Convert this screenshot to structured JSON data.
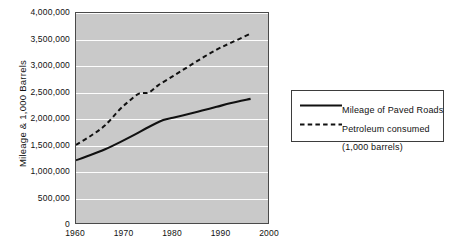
{
  "chart_data": {
    "type": "line",
    "title": "",
    "xlabel": "",
    "ylabel": "Mileage & 1,000 Barrels",
    "xlim": [
      1960,
      2000
    ],
    "ylim": [
      0,
      4000000
    ],
    "grid": true,
    "legend_position": "right",
    "x_ticks": [
      "1960",
      "1970",
      "1980",
      "1990",
      "2000"
    ],
    "x_tick_values": [
      1960,
      1970,
      1980,
      1990,
      2000
    ],
    "y_ticks": [
      "0",
      "500,000",
      "1,000,000",
      "1,500,000",
      "2,000,000",
      "2,500,000",
      "3,000,000",
      "3,500,000",
      "4,000,000"
    ],
    "y_tick_values": [
      0,
      500000,
      1000000,
      1500000,
      2000000,
      2500000,
      3000000,
      3500000,
      4000000
    ],
    "plot_background": "#c9c9c9",
    "gridline_color": "#fdfdfd",
    "series": [
      {
        "name": "Mileage of Paved Roads",
        "style": "solid",
        "color": "#111111",
        "x": [
          1960,
          1963,
          1966,
          1969,
          1972,
          1975,
          1978,
          1980,
          1983,
          1986,
          1989,
          1992,
          1996
        ],
        "values": [
          1220000,
          1320000,
          1430000,
          1560000,
          1700000,
          1850000,
          1980000,
          2025000,
          2090000,
          2160000,
          2230000,
          2300000,
          2380000
        ]
      },
      {
        "name": "Petroleum consumed",
        "sublabel": "(1,000 barrels)",
        "style": "dashed",
        "color": "#111111",
        "x": [
          1960,
          1963,
          1966,
          1969,
          1971,
          1973,
          1975,
          1977,
          1980,
          1983,
          1986,
          1989,
          1992,
          1996
        ],
        "values": [
          1510000,
          1680000,
          1880000,
          2180000,
          2340000,
          2480000,
          2500000,
          2640000,
          2810000,
          2980000,
          3150000,
          3310000,
          3440000,
          3610000
        ]
      }
    ]
  },
  "legend": {
    "entries": [
      {
        "label": "Mileage of Paved Roads",
        "sublabel": "",
        "style": "solid"
      },
      {
        "label": "Petroleum consumed",
        "sublabel": "(1,000 barrels)",
        "style": "dashed"
      }
    ]
  }
}
